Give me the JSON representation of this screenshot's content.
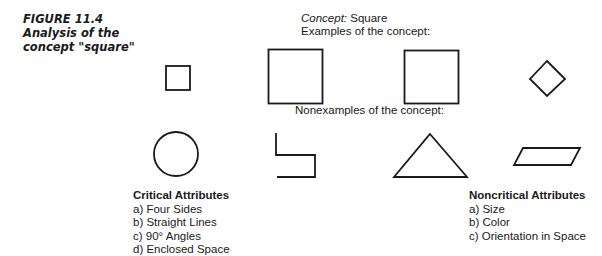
{
  "caption": {
    "figure_number": "FIGURE 11.4",
    "line2": "Analysis of the",
    "line3": "concept \"square\""
  },
  "concept": {
    "label": "Concept:",
    "value": "Square"
  },
  "examples_heading": "Examples of the concept:",
  "nonexamples_heading": "Nonexamples of the concept:",
  "examples": [
    {
      "shape": "small-square"
    },
    {
      "shape": "large-square"
    },
    {
      "shape": "large-square"
    },
    {
      "shape": "rotated-square-diamond"
    }
  ],
  "nonexamples": [
    {
      "shape": "circle"
    },
    {
      "shape": "open-zigzag-lines"
    },
    {
      "shape": "triangle"
    },
    {
      "shape": "parallelogram"
    }
  ],
  "critical_attributes": {
    "title": "Critical Attributes",
    "items": [
      "a)  Four Sides",
      "b)  Straight Lines",
      "c)  90° Angles",
      "d)  Enclosed Space"
    ]
  },
  "noncritical_attributes": {
    "title": "Noncritical Attributes",
    "items": [
      "a)  Size",
      "b)  Color",
      "c)  Orientation in Space"
    ]
  },
  "colors": {
    "stroke": "#1a1a1a",
    "background": "#ffffff"
  }
}
